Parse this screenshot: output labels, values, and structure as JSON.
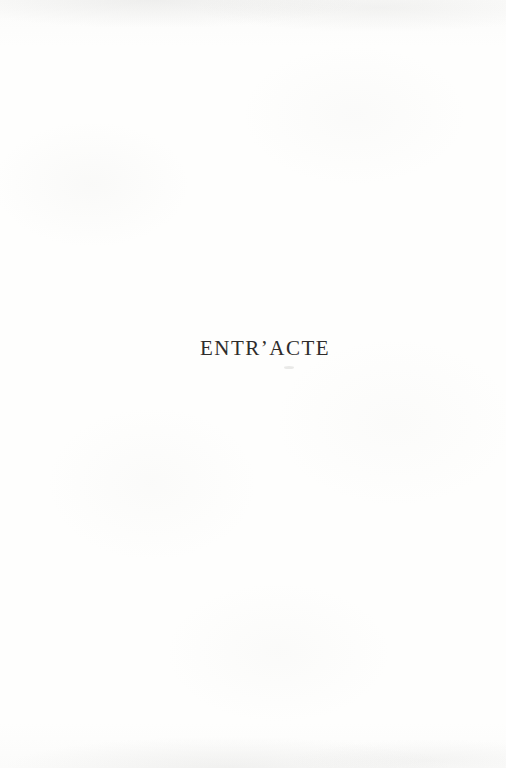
{
  "page": {
    "heading": "ENTR’ACTE",
    "background_color": "#fefefd",
    "text_color": "#2e2c2b"
  }
}
